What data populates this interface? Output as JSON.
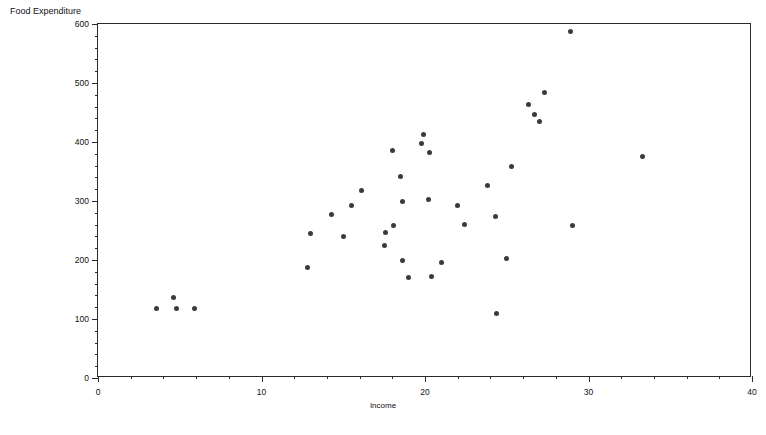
{
  "chart_data": {
    "type": "scatter",
    "title": "",
    "xlabel": "Income",
    "ylabel": "Food Expenditure",
    "xlim": [
      0,
      40
    ],
    "ylim": [
      0,
      600
    ],
    "xticks": [
      0,
      10,
      20,
      30,
      40
    ],
    "yticks": [
      0,
      100,
      200,
      300,
      400,
      500,
      600
    ],
    "x_minor_step": 2,
    "y_minor_step": 20,
    "grid": false,
    "legend": null,
    "marker": "filled-circle",
    "marker_color": "#3b3b3b",
    "points": [
      {
        "x": 3.6,
        "y": 118
      },
      {
        "x": 4.6,
        "y": 136
      },
      {
        "x": 4.8,
        "y": 118
      },
      {
        "x": 5.9,
        "y": 117
      },
      {
        "x": 12.8,
        "y": 188
      },
      {
        "x": 13.0,
        "y": 245
      },
      {
        "x": 14.3,
        "y": 277
      },
      {
        "x": 15.0,
        "y": 239
      },
      {
        "x": 15.5,
        "y": 292
      },
      {
        "x": 16.1,
        "y": 318
      },
      {
        "x": 17.6,
        "y": 247
      },
      {
        "x": 17.5,
        "y": 224
      },
      {
        "x": 18.0,
        "y": 386
      },
      {
        "x": 18.1,
        "y": 258
      },
      {
        "x": 18.5,
        "y": 342
      },
      {
        "x": 18.6,
        "y": 300
      },
      {
        "x": 18.6,
        "y": 200
      },
      {
        "x": 19.0,
        "y": 170
      },
      {
        "x": 19.9,
        "y": 412
      },
      {
        "x": 19.8,
        "y": 398
      },
      {
        "x": 20.3,
        "y": 383
      },
      {
        "x": 20.2,
        "y": 303
      },
      {
        "x": 20.4,
        "y": 172
      },
      {
        "x": 21.0,
        "y": 196
      },
      {
        "x": 22.0,
        "y": 293
      },
      {
        "x": 22.4,
        "y": 260
      },
      {
        "x": 23.8,
        "y": 327
      },
      {
        "x": 24.3,
        "y": 273
      },
      {
        "x": 24.4,
        "y": 110
      },
      {
        "x": 25.0,
        "y": 203
      },
      {
        "x": 25.3,
        "y": 358
      },
      {
        "x": 26.3,
        "y": 464
      },
      {
        "x": 26.7,
        "y": 447
      },
      {
        "x": 27.0,
        "y": 435
      },
      {
        "x": 27.3,
        "y": 484
      },
      {
        "x": 28.9,
        "y": 588
      },
      {
        "x": 29.0,
        "y": 258
      },
      {
        "x": 33.3,
        "y": 375
      }
    ]
  }
}
